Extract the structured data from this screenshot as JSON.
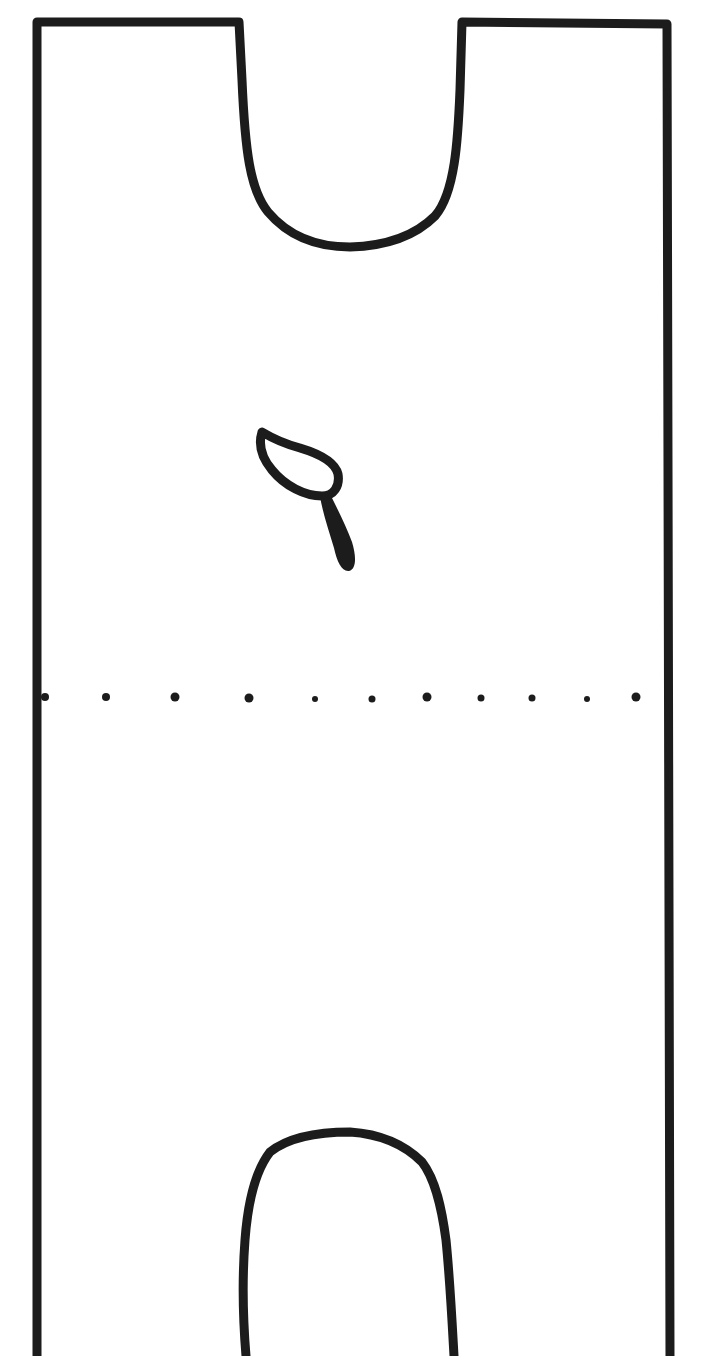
{
  "diagram": {
    "kind": "pattern-piece",
    "colors": {
      "ink": "#1c1c1c",
      "background": "#ffffff"
    },
    "elements": [
      {
        "name": "outer-outline",
        "description": "rectangular piece with open bottom"
      },
      {
        "name": "top-notch",
        "description": "U-shaped cutout at top center"
      },
      {
        "name": "leaf-glyph",
        "description": "small loop with tail symbol in center"
      },
      {
        "name": "fold-line",
        "description": "dotted horizontal line",
        "dot_count": 11
      },
      {
        "name": "bottom-arch",
        "description": "arched cutout at bottom center"
      }
    ]
  }
}
